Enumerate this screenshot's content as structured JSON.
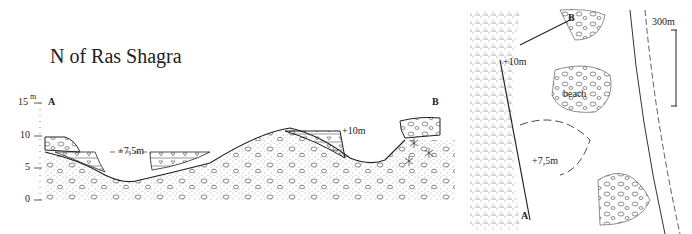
{
  "section": {
    "title": "N of Ras Shagra",
    "axis_unit": "m",
    "y_ticks": [
      "15",
      "10",
      "5",
      "0"
    ],
    "endpoint_a": "A",
    "endpoint_b": "B",
    "terrace_low_label": "+7,5m",
    "terrace_high_label": "+10m"
  },
  "map": {
    "label_a": "A",
    "label_b": "B",
    "label_10m": "+10m",
    "label_75m": "+7,5m",
    "label_beach": "beach",
    "scale_label": "300m"
  },
  "colors": {
    "ink": "#222222",
    "stipple": "#9a9a9a",
    "background": "#ffffff"
  }
}
